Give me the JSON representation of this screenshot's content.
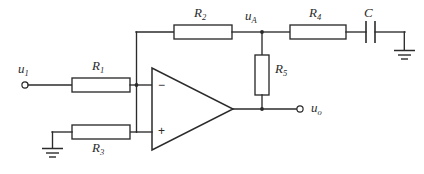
{
  "diagram": {
    "type": "schematic",
    "terminals": [
      {
        "id": "input",
        "label_main": "u",
        "label_sub": "1",
        "name": "input-terminal-u1"
      },
      {
        "id": "output",
        "label_main": "u",
        "label_sub": "o",
        "name": "output-terminal-uo"
      }
    ],
    "nodes": [
      {
        "id": "nodeA",
        "label_main": "u",
        "label_sub": "A",
        "name": "node-label-uA"
      }
    ],
    "components": [
      {
        "id": "R1",
        "label_main": "R",
        "label_sub": "1",
        "kind": "resistor",
        "orientation": "horizontal"
      },
      {
        "id": "R2",
        "label_main": "R",
        "label_sub": "2",
        "kind": "resistor",
        "orientation": "horizontal"
      },
      {
        "id": "R3",
        "label_main": "R",
        "label_sub": "3",
        "kind": "resistor",
        "orientation": "horizontal"
      },
      {
        "id": "R4",
        "label_main": "R",
        "label_sub": "4",
        "kind": "resistor",
        "orientation": "horizontal"
      },
      {
        "id": "R5",
        "label_main": "R",
        "label_sub": "5",
        "kind": "resistor",
        "orientation": "vertical"
      },
      {
        "id": "C",
        "label_main": "C",
        "label_sub": "",
        "kind": "capacitor",
        "orientation": "horizontal"
      }
    ],
    "opamp": {
      "name": "operational-amplifier",
      "inverting_sign": "−",
      "noninverting_sign": "+"
    },
    "grounds": [
      {
        "id": "gnd-left",
        "name": "ground-symbol-left"
      },
      {
        "id": "gnd-right",
        "name": "ground-symbol-right"
      }
    ],
    "colors": {
      "line": "#2b2b2b",
      "background": "#ffffff",
      "fill": "#ffffff"
    }
  }
}
